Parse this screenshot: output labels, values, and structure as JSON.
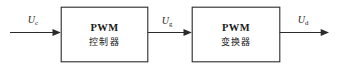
{
  "diagram": {
    "stroke_color": "#2b2b2b",
    "text_color": "#1a1a1a",
    "background_color": "#ffffff",
    "blocks": [
      {
        "id": "pwm-controller",
        "line1": "PWM",
        "line2": "控制器"
      },
      {
        "id": "pwm-converter",
        "line1": "PWM",
        "line2": "变换器"
      }
    ],
    "signals": [
      {
        "id": "input-signal",
        "base": "U",
        "subscript": "c"
      },
      {
        "id": "gate-signal",
        "base": "U",
        "subscript": "g"
      },
      {
        "id": "output-signal",
        "base": "U",
        "subscript": "d"
      }
    ]
  }
}
